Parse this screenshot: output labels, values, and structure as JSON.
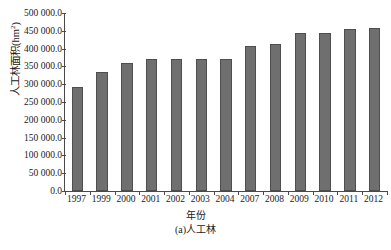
{
  "chart_data": {
    "type": "bar",
    "title": "",
    "caption": "(a)人工林",
    "xlabel": "年份",
    "ylabel": "人工林面积(hm",
    "ylabel_superscript": "2",
    "ylabel_suffix": ")",
    "categories": [
      "1997",
      "1999",
      "2000",
      "2001",
      "2002",
      "2003",
      "2004",
      "2007",
      "2008",
      "2009",
      "2010",
      "2011",
      "2012"
    ],
    "values": [
      293000,
      333000,
      360000,
      370000,
      372000,
      372000,
      370000,
      407000,
      413000,
      445000,
      445000,
      454000,
      458000
    ],
    "ylim": [
      0,
      500000
    ],
    "ytick_values": [
      0,
      50000,
      100000,
      150000,
      200000,
      250000,
      300000,
      350000,
      400000,
      450000,
      500000
    ],
    "ytick_labels": [
      "0.0",
      "50 000.0",
      "100 000.0",
      "150 000.0",
      "200 000.0",
      "250 000.0",
      "300 000.0",
      "350 000.0",
      "400 000.0",
      "450 000.0",
      "500 000.0"
    ],
    "grid": false,
    "legend": null,
    "bar_color": "#6f6f6f",
    "bar_border_color": "#4e4e4e",
    "axis_color": "#4a4a4a"
  }
}
